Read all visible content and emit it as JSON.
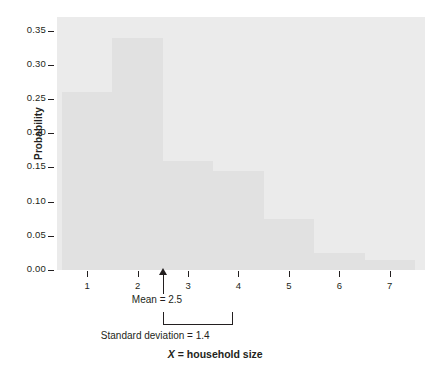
{
  "chart_data": {
    "type": "bar",
    "title": "",
    "subtitle": "",
    "xlabel": "X = household size",
    "ylabel": "Probability",
    "categories": [
      "1",
      "2",
      "3",
      "4",
      "5",
      "6",
      "7"
    ],
    "values": [
      0.26,
      0.34,
      0.16,
      0.145,
      0.075,
      0.025,
      0.015
    ],
    "series": [
      {
        "name": "Probability",
        "values": [
          0.26,
          0.34,
          0.16,
          0.145,
          0.075,
          0.025,
          0.015
        ]
      }
    ],
    "xlim": [
      0.4,
      7.7
    ],
    "ylim": [
      0.0,
      0.37
    ],
    "y_ticks": [
      0.0,
      0.05,
      0.1,
      0.15,
      0.2,
      0.25,
      0.3,
      0.35
    ],
    "y_tick_labels": [
      "0.00",
      "0.05",
      "0.10",
      "0.15",
      "0.20",
      "0.25",
      "0.30",
      "0.35"
    ],
    "x_ticks": [
      1,
      2,
      3,
      4,
      5,
      6,
      7
    ],
    "x_tick_labels": [
      "1",
      "2",
      "3",
      "4",
      "5",
      "6",
      "7"
    ],
    "grid": false,
    "legend": false,
    "bar_color": "#e1e1e1",
    "panel_color": "#ebebeb",
    "text_color": "#231f20",
    "annotations": [
      {
        "kind": "arrow",
        "label": "Mean = 2.5",
        "x": 2.5,
        "value": 2.5
      },
      {
        "kind": "bracket",
        "label": "Standard deviation = 1.4",
        "x_start": 2.5,
        "x_end": 3.9,
        "value": 1.4
      }
    ]
  },
  "axis": {
    "y_title": "Probability",
    "x_title_variable": "X",
    "x_title_rest": " = household size"
  },
  "annotations": {
    "mean_label": "Mean = 2.5",
    "sd_label": "Standard deviation = 1.4"
  }
}
